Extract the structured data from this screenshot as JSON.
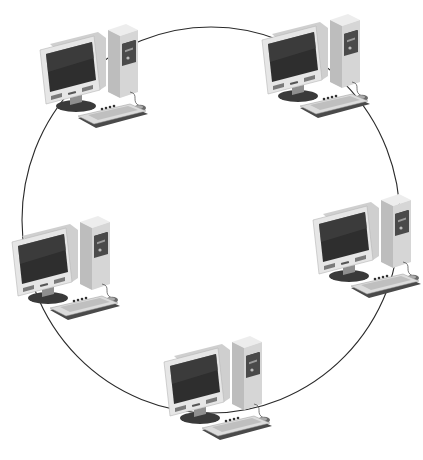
{
  "diagram": {
    "type": "ring-network-topology",
    "ring": {
      "cx": 211,
      "cy": 220,
      "rx": 189,
      "ry": 193,
      "stroke": "#2a2a2a"
    },
    "colors": {
      "case_light": "#e4e4e4",
      "case_mid": "#c9c9c9",
      "case_dark": "#9a9a9a",
      "screen": "#2e2e2e",
      "screen_shade": "#4a4a4a",
      "panel": "#3a3a3a",
      "key": "#f2f2f2",
      "shadow": "#555555"
    },
    "nodes": [
      {
        "id": "computer-top-left",
        "x": 30,
        "y": 22
      },
      {
        "id": "computer-top-right",
        "x": 252,
        "y": 12
      },
      {
        "id": "computer-middle-left",
        "x": 2,
        "y": 214
      },
      {
        "id": "computer-middle-right",
        "x": 303,
        "y": 192
      },
      {
        "id": "computer-bottom",
        "x": 154,
        "y": 334
      }
    ]
  }
}
